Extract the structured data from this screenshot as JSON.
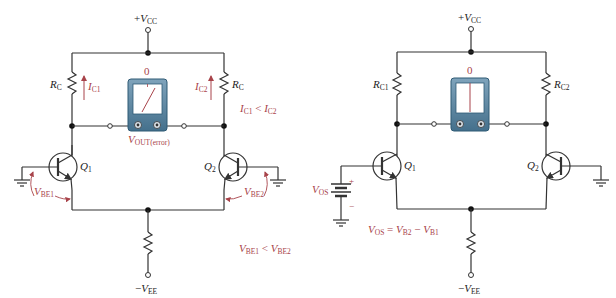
{
  "left_circuit": {
    "supply_top": {
      "sign": "+",
      "symbol": "V",
      "sub": "CC"
    },
    "supply_bottom": {
      "sign": "−",
      "symbol": "V",
      "sub": "EE"
    },
    "rc_left": {
      "symbol": "R",
      "sub": "C"
    },
    "rc_right": {
      "symbol": "R",
      "sub": "C"
    },
    "ic1": {
      "symbol": "I",
      "sub": "C1"
    },
    "ic2": {
      "symbol": "I",
      "sub": "C2"
    },
    "meter_zero": "0",
    "meter_label": {
      "symbol": "V",
      "sub": "OUT(error)"
    },
    "q1": {
      "symbol": "Q",
      "sub": "1"
    },
    "q2": {
      "symbol": "Q",
      "sub": "2"
    },
    "vbe1": {
      "symbol": "V",
      "sub": "BE1"
    },
    "vbe2": {
      "symbol": "V",
      "sub": "BE2"
    },
    "ic_relation": {
      "a": "I",
      "a_sub": "C1",
      "op": " < ",
      "b": "I",
      "b_sub": "C2"
    },
    "vbe_relation": {
      "a": "V",
      "a_sub": "BE1",
      "op": " < ",
      "b": "V",
      "b_sub": "BE2"
    }
  },
  "right_circuit": {
    "supply_top": {
      "sign": "+",
      "symbol": "V",
      "sub": "CC"
    },
    "supply_bottom": {
      "sign": "−",
      "symbol": "V",
      "sub": "EE"
    },
    "rc1": {
      "symbol": "R",
      "sub": "C1"
    },
    "rc2": {
      "symbol": "R",
      "sub": "C2"
    },
    "meter_zero": "0",
    "q1": {
      "symbol": "Q",
      "sub": "1"
    },
    "q2": {
      "symbol": "Q",
      "sub": "2"
    },
    "vos": {
      "symbol": "V",
      "sub": "OS"
    },
    "battery_plus": "+",
    "battery_minus": "−",
    "vos_relation": {
      "a": "V",
      "a_sub": "OS",
      "eq": " = ",
      "b": "V",
      "b_sub": "B2",
      "op": " − ",
      "c": "V",
      "c_sub": "B1"
    }
  },
  "colors": {
    "wire": "#333333",
    "annotation": "#a8434a",
    "meter_body": "#5b87a3",
    "meter_face": "#ffffff"
  }
}
